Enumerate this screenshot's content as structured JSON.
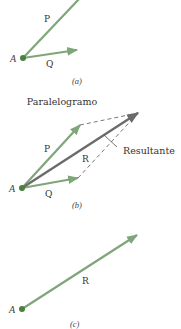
{
  "colors": {
    "vector_green": "#7fa57a",
    "resultant_gray": "#6b6b6b",
    "point_green": "#4a7f3e",
    "dashed": "#555555",
    "text": "#333333"
  },
  "panels": {
    "a": {
      "caption": "(a)",
      "point_label": "A",
      "vectors": [
        {
          "name": "P",
          "label": "P"
        },
        {
          "name": "Q",
          "label": "Q"
        }
      ]
    },
    "b": {
      "caption": "(b)",
      "title": "Paralelogramo",
      "point_label": "A",
      "resultant_label": "Resultante",
      "vectors": [
        {
          "name": "P",
          "label": "P"
        },
        {
          "name": "Q",
          "label": "Q"
        },
        {
          "name": "R",
          "label": "R"
        }
      ]
    },
    "c": {
      "caption": "(c)",
      "point_label": "A",
      "vectors": [
        {
          "name": "R",
          "label": "R"
        }
      ]
    }
  }
}
